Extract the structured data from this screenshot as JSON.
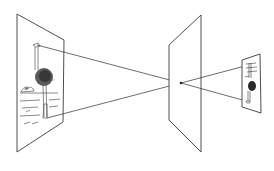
{
  "diagram": {
    "elements": [
      {
        "id": "object-plane",
        "label": "",
        "content": "ostrich-illustration"
      },
      {
        "id": "pinhole-plane",
        "label": "",
        "content": "pinhole"
      },
      {
        "id": "image-plane",
        "label": "",
        "content": "inverted-ostrich-illustration"
      }
    ],
    "rays": [
      {
        "from": "ostrich-head",
        "to": "inverted-feet",
        "via": "pinhole"
      },
      {
        "from": "ostrich-feet",
        "to": "inverted-head",
        "via": "pinhole"
      }
    ],
    "colors": {
      "line": "#2e2e2e",
      "background": "#ffffff"
    }
  }
}
